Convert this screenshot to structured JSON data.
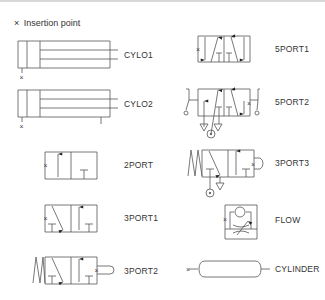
{
  "legend": {
    "marker": "×",
    "text": "Insertion point"
  },
  "symbols": [
    {
      "name": "CYLO1",
      "label": "CYLO1"
    },
    {
      "name": "CYLO2",
      "label": "CYLO2"
    },
    {
      "name": "2PORT",
      "label": "2PORT"
    },
    {
      "name": "3PORT1",
      "label": "3PORT1"
    },
    {
      "name": "3PORT2",
      "label": "3PORT2"
    },
    {
      "name": "5PORT1",
      "label": "5PORT1"
    },
    {
      "name": "5PORT2",
      "label": "5PORT2"
    },
    {
      "name": "3PORT3",
      "label": "3PORT3"
    },
    {
      "name": "FLOW",
      "label": "FLOW"
    },
    {
      "name": "CYLINDER",
      "label": "CYLINDER"
    }
  ],
  "colors": {
    "line": "#555555",
    "text": "#333333",
    "background": "#ffffff"
  }
}
